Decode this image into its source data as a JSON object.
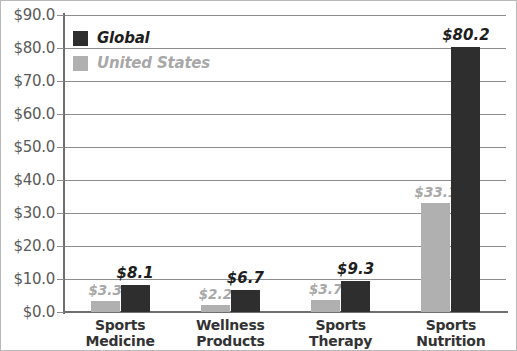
{
  "chart_data": {
    "type": "bar",
    "title": "",
    "subtitle": "",
    "xlabel": "",
    "ylabel": "",
    "ylim": [
      0,
      90
    ],
    "ytick_step": 10,
    "grid": true,
    "legend_position": "top-left",
    "categories": [
      "Sports Medicine",
      "Wellness Products",
      "Sports Therapy",
      "Sports Nutrition"
    ],
    "category_lines": [
      [
        "Sports",
        "Medicine"
      ],
      [
        "Wellness",
        "Products"
      ],
      [
        "Sports",
        "Therapy"
      ],
      [
        "Sports",
        "Nutrition"
      ]
    ],
    "ytick_labels": [
      "$90.0",
      "$80.0",
      "$70.0",
      "$60.0",
      "$50.0",
      "$40.0",
      "$30.0",
      "$20.0",
      "$10.0",
      "$0.0"
    ],
    "ytick_values": [
      90,
      80,
      70,
      60,
      50,
      40,
      30,
      20,
      10,
      0
    ],
    "series": [
      {
        "name": "United States",
        "color": "#b0b0b0",
        "values": [
          3.3,
          2.2,
          3.7,
          33.1
        ],
        "labels": [
          "$3.3",
          "$2.2",
          "$3.7",
          "$33.1"
        ]
      },
      {
        "name": "Global",
        "color": "#2e2e2e",
        "values": [
          8.1,
          6.7,
          9.3,
          80.2
        ],
        "labels": [
          "$8.1",
          "$6.7",
          "$9.3",
          "$80.2"
        ]
      }
    ]
  },
  "legend": {
    "items": [
      {
        "label": "Global",
        "color": "#2e2e2e"
      },
      {
        "label": "United States",
        "color": "#b0b0b0"
      }
    ]
  },
  "colors": {
    "global": "#2e2e2e",
    "united_states": "#b0b0b0",
    "gridline": "#8d8d8d",
    "axis": "#6e6e6e",
    "tick_label": "#5a5a5a",
    "category_label": "#333333",
    "background": "#ffffff"
  }
}
